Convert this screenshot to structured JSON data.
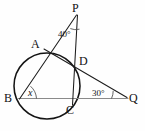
{
  "figure": {
    "kind": "circle-secant-angle-diagram",
    "background_color": "#fefefe",
    "line_color": "#1c1c1c",
    "circle_color": "#141414",
    "baseline_color": "#8a8a8a",
    "width": 145,
    "height": 131
  },
  "points": {
    "P": {
      "label": "P",
      "x": 77,
      "y": 9
    },
    "A": {
      "label": "A",
      "x": 40,
      "y": 47
    },
    "D": {
      "label": "D",
      "x": 78,
      "y": 63
    },
    "B": {
      "label": "B",
      "x": 12,
      "y": 99
    },
    "C": {
      "label": "C",
      "x": 71,
      "y": 103
    },
    "Q": {
      "label": "Q",
      "x": 131,
      "y": 99
    }
  },
  "angles": {
    "at_P": {
      "label": "40°",
      "value": 40,
      "unit": "degrees",
      "x": 62,
      "y": 30
    },
    "at_Q": {
      "label": "30°",
      "value": 30,
      "unit": "degrees",
      "x": 96,
      "y": 90
    },
    "at_B": {
      "label": "x",
      "value": null,
      "unit": "unknown",
      "x": 29,
      "y": 90
    }
  },
  "circle": {
    "center_x": 47,
    "center_y": 86,
    "radius": 33
  },
  "segments": [
    {
      "name": "P-to-B-secant",
      "from": "P",
      "to": "B",
      "through": [
        "A"
      ]
    },
    {
      "name": "P-to-C-secant",
      "from": "P",
      "to": "C",
      "through": [
        "D"
      ]
    },
    {
      "name": "A-to-Q-secant",
      "from": "A",
      "to": "Q",
      "through": [
        "D"
      ]
    },
    {
      "name": "B-to-Q-baseline",
      "from": "B",
      "to": "Q",
      "through": [
        "C"
      ]
    }
  ]
}
